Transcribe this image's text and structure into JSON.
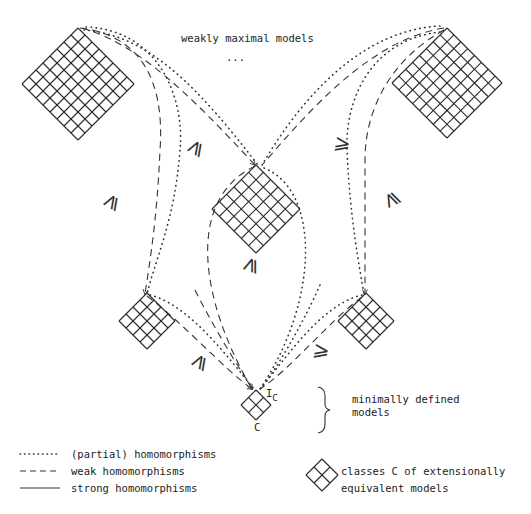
{
  "diagram": {
    "top_label": "weakly maximal models",
    "ellipsis": "...",
    "bottom_bracket_label_line1": "minimally defined",
    "bottom_bracket_label_line2": "models",
    "bottom_node_top_label": "I",
    "bottom_node_top_label_sub": "C",
    "bottom_node_bottom_label": "C",
    "order_symbol": "⩾",
    "nodes": [
      {
        "id": "top-left",
        "grid": 8
      },
      {
        "id": "top-right",
        "grid": 8
      },
      {
        "id": "center",
        "grid": 6
      },
      {
        "id": "mid-left",
        "grid": 4
      },
      {
        "id": "mid-right",
        "grid": 4
      },
      {
        "id": "bottom",
        "grid": 2
      }
    ]
  },
  "legend": {
    "dotted": "(partial) homomorphisms",
    "dashed": "weak homomorphisms",
    "solid": "strong homomorphisms",
    "diamond_line1": "classes  C  of extensionally",
    "diamond_line2": "equivalent models"
  },
  "colors": {
    "ink": "#2a2a2a",
    "background": "#ffffff"
  }
}
